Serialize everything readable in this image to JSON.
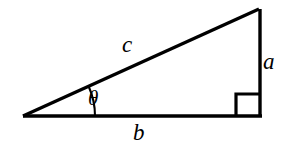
{
  "figure": {
    "name": "right-triangle-trigonometry-diagram",
    "background_color": "#ffffff",
    "stroke_color": "#000000",
    "labels": {
      "hypotenuse": "c",
      "opposite_side": "a",
      "adjacent_side": "b",
      "angle": "θ"
    },
    "geometry": {
      "left_vertex": [
        23,
        116
      ],
      "bottom_right_vertex": [
        261,
        116
      ],
      "top_right_vertex": [
        259,
        9
      ],
      "right_angle_marker": {
        "x": 236,
        "y": 94,
        "width": 23,
        "height": 22
      },
      "angle_arc": {
        "center": [
          23,
          116
        ],
        "radius": 72,
        "from_side": "adjacent",
        "to_side": "hypotenuse"
      },
      "stroke_width": 3
    }
  }
}
